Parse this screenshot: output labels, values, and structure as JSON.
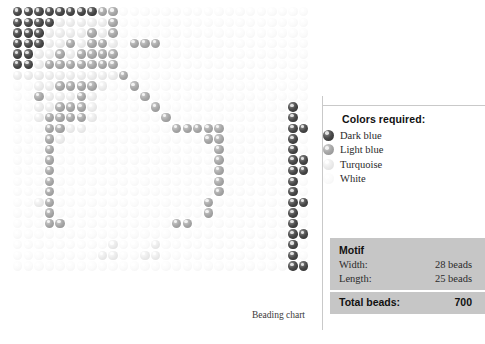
{
  "chart": {
    "caption": "Beading chart",
    "grid": {
      "columns": 28,
      "rows": 25,
      "palette": {
        "0": "#4a4a4a",
        "1": "#a8a8a8",
        "2": "#ececec",
        "3": "#fbfbfb",
        "4": "#6a6a6a"
      },
      "cells": [
        [
          0,
          0,
          0,
          0,
          0,
          0,
          0,
          0,
          1,
          1,
          3,
          3,
          3,
          3,
          3,
          3,
          3,
          3,
          3,
          3,
          3,
          3,
          3,
          3,
          3,
          3,
          3,
          3
        ],
        [
          0,
          0,
          0,
          0,
          2,
          2,
          2,
          2,
          2,
          1,
          3,
          3,
          3,
          3,
          3,
          3,
          3,
          3,
          3,
          3,
          3,
          3,
          3,
          3,
          3,
          3,
          3,
          3
        ],
        [
          0,
          0,
          0,
          2,
          2,
          2,
          2,
          1,
          2,
          1,
          3,
          3,
          3,
          3,
          3,
          3,
          3,
          3,
          3,
          3,
          3,
          3,
          3,
          3,
          3,
          3,
          3,
          3
        ],
        [
          0,
          0,
          0,
          2,
          2,
          1,
          2,
          1,
          1,
          2,
          3,
          1,
          1,
          1,
          3,
          3,
          3,
          3,
          3,
          3,
          3,
          3,
          3,
          3,
          3,
          3,
          3,
          3
        ],
        [
          0,
          0,
          2,
          2,
          1,
          2,
          1,
          1,
          1,
          1,
          3,
          3,
          3,
          3,
          3,
          3,
          3,
          3,
          3,
          3,
          3,
          3,
          3,
          3,
          3,
          3,
          3,
          3
        ],
        [
          0,
          0,
          2,
          1,
          1,
          1,
          1,
          1,
          1,
          1,
          3,
          3,
          3,
          3,
          3,
          3,
          3,
          3,
          3,
          3,
          3,
          3,
          3,
          3,
          3,
          3,
          3,
          3
        ],
        [
          2,
          2,
          2,
          2,
          2,
          2,
          2,
          2,
          2,
          2,
          1,
          3,
          3,
          3,
          3,
          3,
          3,
          3,
          3,
          3,
          3,
          3,
          3,
          3,
          3,
          3,
          3,
          3
        ],
        [
          3,
          3,
          2,
          2,
          1,
          1,
          1,
          1,
          2,
          3,
          3,
          1,
          3,
          3,
          3,
          3,
          3,
          3,
          3,
          3,
          3,
          3,
          3,
          3,
          3,
          3,
          3,
          3
        ],
        [
          3,
          3,
          1,
          2,
          2,
          2,
          1,
          2,
          3,
          3,
          3,
          3,
          1,
          3,
          3,
          3,
          3,
          3,
          3,
          3,
          3,
          3,
          3,
          3,
          3,
          3,
          3,
          3
        ],
        [
          3,
          3,
          2,
          2,
          1,
          1,
          1,
          2,
          3,
          3,
          3,
          3,
          3,
          1,
          3,
          3,
          3,
          3,
          3,
          3,
          3,
          3,
          3,
          3,
          3,
          3,
          0,
          3
        ],
        [
          3,
          3,
          2,
          1,
          1,
          1,
          1,
          2,
          3,
          3,
          3,
          3,
          3,
          3,
          1,
          3,
          3,
          3,
          3,
          3,
          3,
          3,
          3,
          3,
          3,
          3,
          0,
          3
        ],
        [
          3,
          3,
          3,
          1,
          1,
          2,
          2,
          3,
          3,
          3,
          3,
          3,
          3,
          3,
          3,
          1,
          1,
          1,
          1,
          1,
          3,
          3,
          3,
          3,
          3,
          3,
          0,
          0
        ],
        [
          3,
          3,
          3,
          1,
          2,
          3,
          3,
          3,
          3,
          3,
          3,
          3,
          3,
          3,
          3,
          3,
          3,
          3,
          1,
          1,
          3,
          3,
          3,
          3,
          3,
          3,
          0,
          3
        ],
        [
          3,
          3,
          3,
          1,
          3,
          3,
          3,
          3,
          3,
          3,
          3,
          3,
          3,
          3,
          3,
          3,
          3,
          3,
          3,
          1,
          3,
          3,
          3,
          3,
          3,
          3,
          0,
          3
        ],
        [
          3,
          3,
          3,
          1,
          3,
          3,
          3,
          3,
          3,
          3,
          3,
          3,
          3,
          3,
          3,
          3,
          3,
          3,
          3,
          1,
          3,
          3,
          3,
          3,
          3,
          3,
          0,
          0
        ],
        [
          3,
          3,
          3,
          1,
          3,
          3,
          3,
          3,
          3,
          3,
          3,
          3,
          3,
          3,
          3,
          3,
          3,
          3,
          3,
          1,
          3,
          3,
          3,
          3,
          3,
          3,
          0,
          0
        ],
        [
          3,
          3,
          3,
          1,
          3,
          3,
          3,
          3,
          3,
          3,
          3,
          3,
          3,
          3,
          3,
          3,
          3,
          3,
          3,
          1,
          3,
          3,
          3,
          3,
          3,
          3,
          0,
          3
        ],
        [
          3,
          3,
          3,
          1,
          3,
          3,
          3,
          3,
          3,
          3,
          3,
          3,
          3,
          3,
          3,
          3,
          3,
          3,
          3,
          1,
          3,
          3,
          3,
          3,
          3,
          3,
          0,
          3
        ],
        [
          3,
          3,
          2,
          1,
          3,
          3,
          3,
          3,
          3,
          3,
          3,
          3,
          3,
          3,
          3,
          3,
          3,
          3,
          1,
          3,
          3,
          3,
          3,
          3,
          3,
          3,
          0,
          0
        ],
        [
          3,
          3,
          3,
          1,
          3,
          3,
          3,
          3,
          3,
          3,
          3,
          3,
          3,
          3,
          3,
          3,
          3,
          3,
          1,
          3,
          3,
          3,
          3,
          3,
          3,
          3,
          0,
          3
        ],
        [
          3,
          3,
          3,
          1,
          1,
          3,
          3,
          3,
          3,
          3,
          3,
          3,
          3,
          3,
          3,
          1,
          1,
          3,
          3,
          3,
          3,
          3,
          3,
          3,
          3,
          3,
          0,
          3
        ],
        [
          3,
          3,
          3,
          3,
          3,
          3,
          3,
          3,
          3,
          3,
          3,
          3,
          3,
          3,
          3,
          3,
          3,
          3,
          3,
          3,
          3,
          3,
          3,
          3,
          3,
          3,
          0,
          0
        ],
        [
          3,
          3,
          3,
          3,
          3,
          3,
          3,
          3,
          3,
          2,
          3,
          3,
          3,
          2,
          3,
          3,
          3,
          3,
          3,
          3,
          3,
          3,
          3,
          3,
          3,
          3,
          0,
          3
        ],
        [
          3,
          3,
          3,
          3,
          3,
          3,
          3,
          3,
          2,
          2,
          3,
          3,
          2,
          2,
          3,
          3,
          3,
          3,
          3,
          3,
          3,
          3,
          3,
          3,
          3,
          3,
          0,
          3
        ],
        [
          3,
          3,
          3,
          3,
          3,
          3,
          3,
          3,
          3,
          3,
          3,
          3,
          3,
          3,
          3,
          3,
          3,
          3,
          3,
          3,
          3,
          3,
          3,
          3,
          3,
          3,
          0,
          0
        ]
      ]
    }
  },
  "legend": {
    "title": "Colors required:",
    "items": [
      {
        "label": "Dark blue",
        "swatch": 0
      },
      {
        "label": "Light blue",
        "swatch": 1
      },
      {
        "label": "Turquoise",
        "swatch": 2
      },
      {
        "label": "White",
        "swatch": 3
      },
      {
        "label": "Pink",
        "swatch": 4
      }
    ]
  },
  "motif": {
    "title": "Motif",
    "width_label": "Width:",
    "width_value": "28 beads",
    "length_label": "Length:",
    "length_value": "25 beads",
    "total_label": "Total beads:",
    "total_value": "700"
  }
}
